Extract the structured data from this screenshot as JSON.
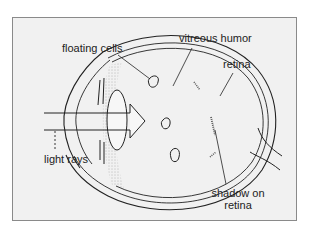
{
  "diagram": {
    "labels": {
      "floating_cells": "floating cells",
      "vitreous_humor": "vitreous humor",
      "retina": "retina",
      "light_rays": "light rays",
      "shadow_on_retina_line1": "shadow on",
      "shadow_on_retina_line2": "retina"
    },
    "colors": {
      "background": "#f1f1f1",
      "frame_border": "#8a8a8a",
      "line": "#222222"
    }
  }
}
